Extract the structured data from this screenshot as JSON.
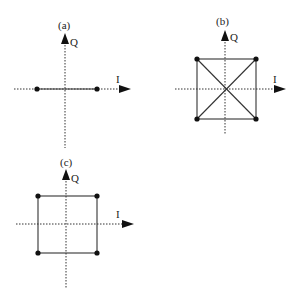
{
  "panels": [
    {
      "id": "a",
      "label": "(a)",
      "axis_q_label": "Q",
      "axis_i_label": "I",
      "constellation": "BPSK",
      "points": [
        [
          -1,
          0
        ],
        [
          1,
          0
        ]
      ]
    },
    {
      "id": "b",
      "label": "(b)",
      "axis_q_label": "Q",
      "axis_i_label": "I",
      "constellation": "QPSK with diagonal transitions",
      "points": [
        [
          -1,
          1
        ],
        [
          1,
          1
        ],
        [
          -1,
          -1
        ],
        [
          1,
          -1
        ]
      ]
    },
    {
      "id": "c",
      "label": "(c)",
      "axis_q_label": "Q",
      "axis_i_label": "I",
      "constellation": "QPSK without diagonal transitions",
      "points": [
        [
          -1,
          1
        ],
        [
          1,
          1
        ],
        [
          -1,
          -1
        ],
        [
          1,
          -1
        ]
      ]
    }
  ],
  "colors": {
    "line": "#333333",
    "dot": "#111111",
    "background": "#ffffff"
  }
}
